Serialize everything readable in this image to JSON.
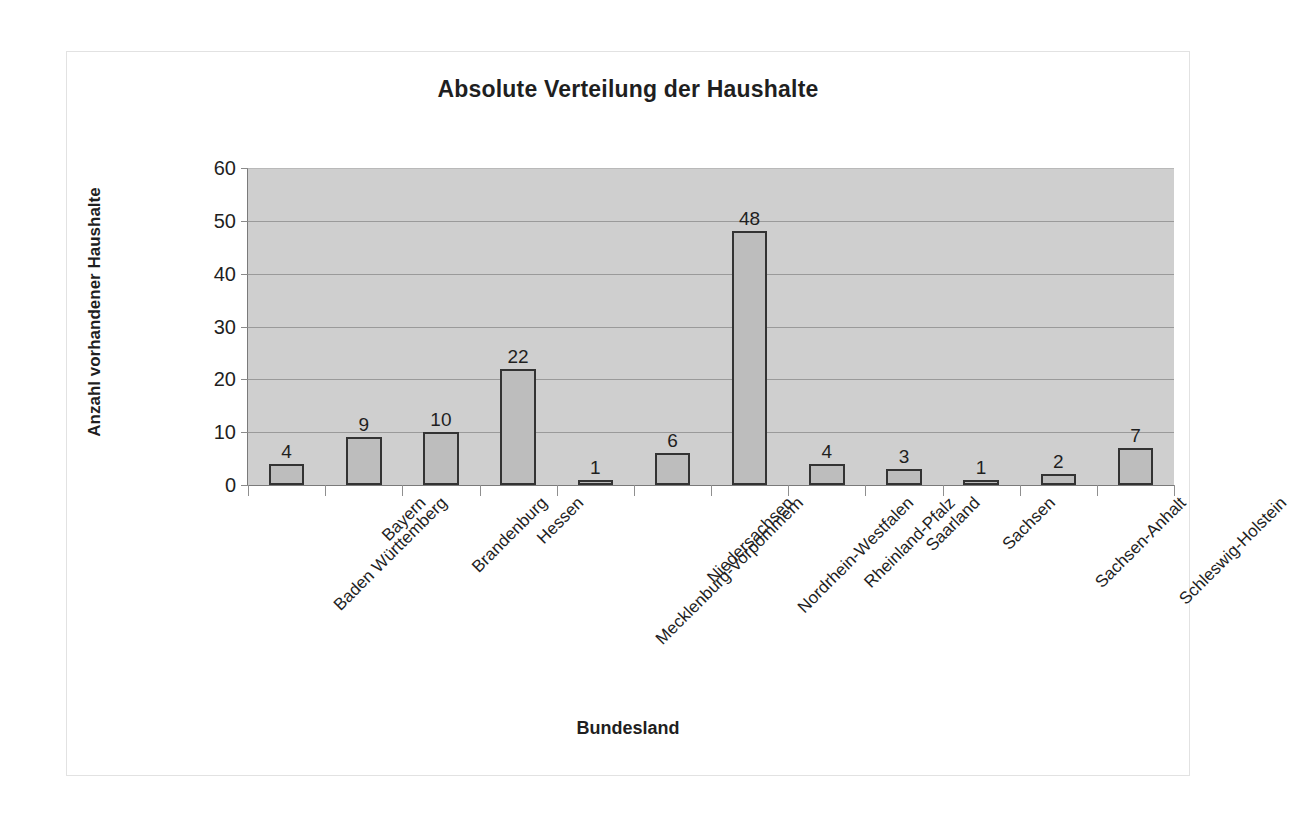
{
  "chart_data": {
    "type": "bar",
    "title": "Absolute Verteilung der Haushalte",
    "xlabel": "Bundesland",
    "ylabel": "Anzahl vorhandener Haushalte",
    "categories": [
      "Baden Württemberg",
      "Bayern",
      "Brandenburg",
      "Hessen",
      "Mecklenburg-Vorpommern",
      "Niedersachsen",
      "Nordrhein-Westfalen",
      "Rheinland-Pfalz",
      "Saarland",
      "Sachsen",
      "Sachsen-Anhalt",
      "Schleswig-Holstein"
    ],
    "values": [
      4,
      9,
      10,
      22,
      1,
      6,
      48,
      4,
      3,
      1,
      2,
      7
    ],
    "ylim": [
      0,
      60
    ],
    "yticks": [
      0,
      10,
      20,
      30,
      40,
      50,
      60
    ],
    "ytick_labels": [
      "0",
      "10",
      "20",
      "30",
      "40",
      "50",
      "60"
    ],
    "grid": true,
    "legend": false,
    "data_labels": true,
    "colors": {
      "bar_fill": "#bdbdbd",
      "bar_border": "#333333",
      "plot_background": "#cfcfcf",
      "gridline": "#9a9a9a",
      "axis": "#7a7a7a",
      "text": "#1f1f1f",
      "figure_background": "#ffffff",
      "figure_border": "#e2e2e2"
    }
  }
}
